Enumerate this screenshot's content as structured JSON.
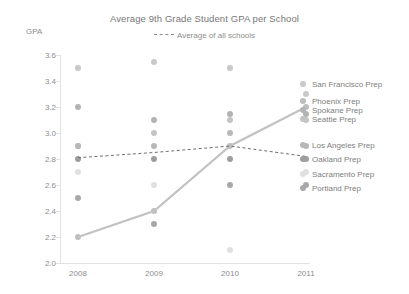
{
  "chart_data": {
    "type": "scatter",
    "title": "Average 9th Grade Student GPA per School",
    "xlabel": "",
    "ylabel": "GPA",
    "ylim": [
      2.0,
      3.6
    ],
    "yticks": [
      "3.6",
      "3.4",
      "3.2",
      "3.0",
      "2.8",
      "2.6",
      "2.4",
      "2.2",
      "2.0"
    ],
    "grid": false,
    "legend_position": "right",
    "categories": [
      "2008",
      "2009",
      "2010",
      "2011"
    ],
    "x": [
      2008,
      2009,
      2010,
      2011
    ],
    "annotation_legend": {
      "label": "Average of all schools",
      "style": "dashed-line"
    },
    "series": [
      {
        "name": "San Francisco Prep",
        "color": "#c9c9c9",
        "marker": "circle",
        "values": [
          3.5,
          3.55,
          3.5,
          3.3
        ]
      },
      {
        "name": "Phoenix Prep",
        "color": "#bdbdbd",
        "marker": "circle",
        "line": "solid",
        "highlight": true,
        "values": [
          2.2,
          2.4,
          2.9,
          3.2
        ]
      },
      {
        "name": "Spokane Prep",
        "color": "#b3b3b3",
        "marker": "circle",
        "values": [
          3.2,
          3.1,
          3.15,
          3.15
        ]
      },
      {
        "name": "Seattle Prep",
        "color": "#c4c4c4",
        "marker": "circle",
        "values": [
          2.9,
          3.0,
          3.1,
          3.1
        ]
      },
      {
        "name": "Los Angeles Prep",
        "color": "#b8b8b8",
        "marker": "circle",
        "values": [
          2.9,
          2.9,
          3.0,
          2.9
        ]
      },
      {
        "name": "Oakland Prep",
        "color": "#9e9e9e",
        "marker": "circle",
        "values": [
          2.8,
          2.8,
          2.8,
          2.8
        ]
      },
      {
        "name": "Sacramento Prep",
        "color": "#e0e0e0",
        "marker": "circle",
        "values": [
          2.7,
          2.6,
          2.1,
          2.7
        ]
      },
      {
        "name": "Portland Prep",
        "color": "#a8a8a8",
        "marker": "circle",
        "values": [
          2.5,
          2.3,
          2.6,
          2.6
        ]
      }
    ],
    "average_line": {
      "name": "Average of all schools",
      "style": "dashed",
      "color": "#6f6f6f",
      "values": [
        2.81,
        2.85,
        2.9,
        2.82
      ]
    },
    "highlight_line": {
      "name": "Phoenix Prep",
      "style": "solid",
      "color": "#c2c2c2",
      "values": [
        2.2,
        2.4,
        2.9,
        3.2
      ]
    },
    "colors": {
      "axis": "#e2e2e2",
      "text": "#8d8d8d",
      "background": "#ffffff"
    }
  }
}
